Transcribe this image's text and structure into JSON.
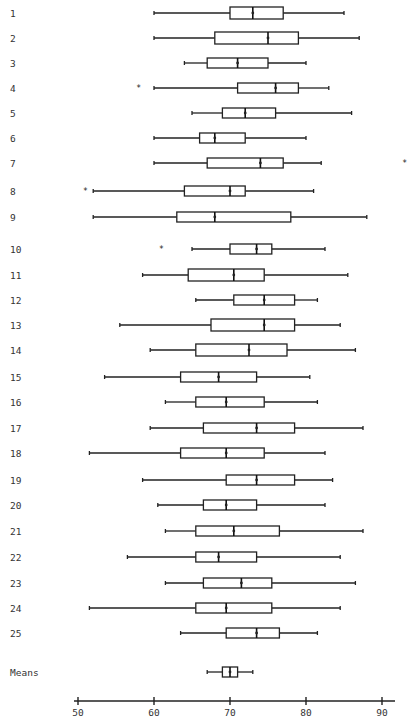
{
  "chart_data": {
    "type": "boxplot",
    "orientation": "horizontal",
    "title": "",
    "xlabel": "",
    "ylabel": "",
    "xlim": [
      48,
      93
    ],
    "x_ticks": [
      50,
      60,
      70,
      80,
      90
    ],
    "grid": false,
    "legend": null,
    "categories": [
      "1",
      "2",
      "3",
      "4",
      "5",
      "6",
      "7",
      "8",
      "9",
      "10",
      "11",
      "12",
      "13",
      "14",
      "15",
      "16",
      "17",
      "18",
      "19",
      "20",
      "21",
      "22",
      "23",
      "24",
      "25",
      "Means"
    ],
    "boxes": [
      {
        "label": "1",
        "min": 60,
        "q1": 70,
        "median": 73,
        "q3": 77,
        "max": 85,
        "outliers": []
      },
      {
        "label": "2",
        "min": 60,
        "q1": 68,
        "median": 75,
        "q3": 79,
        "max": 87,
        "outliers": []
      },
      {
        "label": "3",
        "min": 64,
        "q1": 67,
        "median": 71,
        "q3": 75,
        "max": 80,
        "outliers": []
      },
      {
        "label": "4",
        "min": 60,
        "q1": 71,
        "median": 76,
        "q3": 79,
        "max": 83,
        "outliers": [
          58
        ]
      },
      {
        "label": "5",
        "min": 65,
        "q1": 69,
        "median": 72,
        "q3": 76,
        "max": 86,
        "outliers": []
      },
      {
        "label": "6",
        "min": 60,
        "q1": 66,
        "median": 68,
        "q3": 72,
        "max": 80,
        "outliers": []
      },
      {
        "label": "7",
        "min": 60,
        "q1": 67,
        "median": 74,
        "q3": 77,
        "max": 82,
        "outliers": [
          93
        ]
      },
      {
        "label": "8",
        "min": 52,
        "q1": 64,
        "median": 70,
        "q3": 72,
        "max": 81,
        "outliers": [
          51
        ]
      },
      {
        "label": "9",
        "min": 52,
        "q1": 63,
        "median": 68,
        "q3": 78,
        "max": 88,
        "outliers": []
      },
      {
        "label": "10",
        "min": 65,
        "q1": 70,
        "median": 73.5,
        "q3": 75.5,
        "max": 82.5,
        "outliers": [
          61
        ]
      },
      {
        "label": "11",
        "min": 58.5,
        "q1": 64.5,
        "median": 70.5,
        "q3": 74.5,
        "max": 85.5,
        "outliers": []
      },
      {
        "label": "12",
        "min": 65.5,
        "q1": 70.5,
        "median": 74.5,
        "q3": 78.5,
        "max": 81.5,
        "outliers": []
      },
      {
        "label": "13",
        "min": 55.5,
        "q1": 67.5,
        "median": 74.5,
        "q3": 78.5,
        "max": 84.5,
        "outliers": []
      },
      {
        "label": "14",
        "min": 59.5,
        "q1": 65.5,
        "median": 72.5,
        "q3": 77.5,
        "max": 86.5,
        "outliers": []
      },
      {
        "label": "15",
        "min": 53.5,
        "q1": 63.5,
        "median": 68.5,
        "q3": 73.5,
        "max": 80.5,
        "outliers": []
      },
      {
        "label": "16",
        "min": 61.5,
        "q1": 65.5,
        "median": 69.5,
        "q3": 74.5,
        "max": 81.5,
        "outliers": []
      },
      {
        "label": "17",
        "min": 59.5,
        "q1": 66.5,
        "median": 73.5,
        "q3": 78.5,
        "max": 87.5,
        "outliers": []
      },
      {
        "label": "18",
        "min": 51.5,
        "q1": 63.5,
        "median": 69.5,
        "q3": 74.5,
        "max": 82.5,
        "outliers": []
      },
      {
        "label": "19",
        "min": 58.5,
        "q1": 69.5,
        "median": 73.5,
        "q3": 78.5,
        "max": 83.5,
        "outliers": []
      },
      {
        "label": "20",
        "min": 60.5,
        "q1": 66.5,
        "median": 69.5,
        "q3": 73.5,
        "max": 82.5,
        "outliers": []
      },
      {
        "label": "21",
        "min": 61.5,
        "q1": 65.5,
        "median": 70.5,
        "q3": 76.5,
        "max": 87.5,
        "outliers": []
      },
      {
        "label": "22",
        "min": 56.5,
        "q1": 65.5,
        "median": 68.5,
        "q3": 73.5,
        "max": 84.5,
        "outliers": []
      },
      {
        "label": "23",
        "min": 61.5,
        "q1": 66.5,
        "median": 71.5,
        "q3": 75.5,
        "max": 86.5,
        "outliers": []
      },
      {
        "label": "24",
        "min": 51.5,
        "q1": 65.5,
        "median": 69.5,
        "q3": 75.5,
        "max": 84.5,
        "outliers": []
      },
      {
        "label": "25",
        "min": 63.5,
        "q1": 69.5,
        "median": 73.5,
        "q3": 76.5,
        "max": 81.5,
        "outliers": []
      },
      {
        "label": "Means",
        "min": 67,
        "q1": 69,
        "median": 70,
        "q3": 71,
        "max": 73,
        "outliers": []
      }
    ]
  },
  "layout": {
    "x0_value": 50,
    "x0_px": 78,
    "px_per_unit": 7.6,
    "row_y": [
      13,
      38,
      63,
      88,
      113,
      138,
      163,
      191,
      217,
      249,
      275,
      300,
      325,
      350,
      377,
      402,
      428,
      453,
      480,
      505,
      531,
      557,
      583,
      608,
      633,
      672
    ],
    "box_half_height": [
      6,
      6,
      5,
      5,
      5,
      5,
      5,
      5,
      5,
      5,
      6,
      5,
      6,
      6,
      5,
      5,
      5,
      5,
      5,
      5,
      5,
      5,
      5,
      5,
      5,
      5
    ],
    "label_x": 10,
    "axis_y": 701,
    "axis_x_start": 74,
    "axis_x_end": 395
  }
}
